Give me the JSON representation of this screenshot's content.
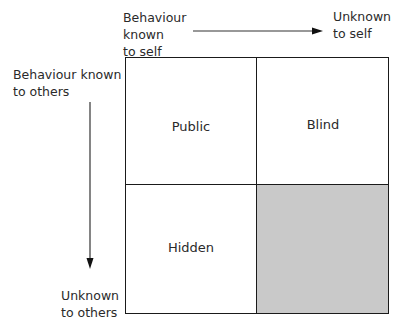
{
  "diagram": {
    "type": "johari-window-quadrant",
    "axis_labels": {
      "top_left": "Behaviour\nknown\nto self",
      "top_right": "Unknown\nto self",
      "left_top": "Behaviour known\nto others",
      "left_bottom": "Unknown\nto others"
    },
    "quadrants": [
      {
        "label": "Public",
        "position": "top-left",
        "fill": "#ffffff"
      },
      {
        "label": "Blind",
        "position": "top-right",
        "fill": "#ffffff"
      },
      {
        "label": "Hidden",
        "position": "bottom-left",
        "fill": "#ffffff"
      },
      {
        "label": "",
        "position": "bottom-right",
        "fill": "#c9c9c9"
      }
    ],
    "colors": {
      "line": "#1a1a1a",
      "shaded": "#c9c9c9"
    }
  }
}
